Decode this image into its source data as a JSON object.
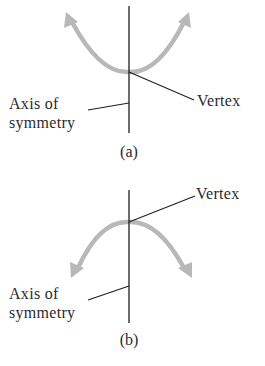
{
  "figures": [
    {
      "id": "a",
      "caption": "(a)",
      "opens": "upward",
      "labels": {
        "axis_line1": "Axis of",
        "axis_line2": "symmetry",
        "vertex": "Vertex"
      }
    },
    {
      "id": "b",
      "caption": "(b)",
      "opens": "downward",
      "labels": {
        "axis_line1": "Axis of",
        "axis_line2": "symmetry",
        "vertex": "Vertex"
      }
    }
  ],
  "colors": {
    "curve": "#b8b8b8",
    "axis": "#1e1e1e",
    "text": "#2b2b2b"
  }
}
